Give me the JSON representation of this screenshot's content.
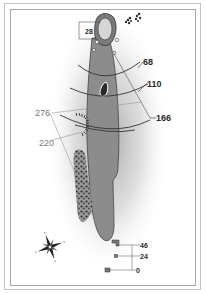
{
  "hole_map": {
    "green_depth_label": "28",
    "yardage_markers_right": [
      "68",
      "110",
      "166"
    ],
    "yardage_markers_left": [
      "276",
      "220"
    ],
    "tee_distances": [
      "46",
      "24",
      "0"
    ],
    "icons": {
      "compass": "compass-rose-icon",
      "trees": "tree-cluster-icon",
      "flag": "pin-icon"
    },
    "colors": {
      "fairway": "#8c8c8c",
      "green": "#c9c9c9",
      "rough_shade": "#9a9a9a",
      "label_dark": "#2a2a2a",
      "label_grey": "#7a7a7a",
      "frame": "#a8a8a8"
    }
  }
}
